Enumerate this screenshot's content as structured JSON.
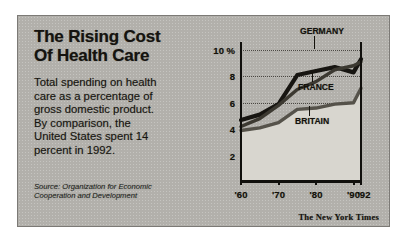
{
  "figure": {
    "headline_lines": [
      "The Rising Cost",
      "Of Health Care"
    ],
    "deck_lines": [
      "Total spending on health",
      "care as a percentage of",
      "gross domestic product.",
      "By comparison, the",
      "United States spent 14",
      "percent in 1992."
    ],
    "source_lines": [
      "Source: Organization for Economic",
      "Cooperation and Development"
    ],
    "credit": "The New York Times",
    "colors": {
      "panel_background": "#b2b0ab",
      "plot_fill": "#d8d6cf",
      "germany_line": "#171511",
      "france_line": "#3c3931",
      "britain_line": "#55524a",
      "ink": "#131109"
    }
  },
  "chart_data": {
    "type": "line",
    "title": "The Rising Cost Of Health Care",
    "subtitle": "Total spending on health care as a percentage of gross domestic product.",
    "xlabel": "",
    "ylabel": "Percent of gross domestic product",
    "xlim": [
      1960,
      1992
    ],
    "ylim": [
      0,
      10.6
    ],
    "yticks": [
      2,
      4,
      6,
      8,
      10
    ],
    "ytick_labels": [
      "2",
      "4",
      "6",
      "8",
      "10 %"
    ],
    "xticks": [
      1960,
      1970,
      1980,
      1990,
      1992
    ],
    "xtick_labels": [
      "'60",
      "'70",
      "'80",
      "'90",
      "'92"
    ],
    "grid": "horizontal-dotted",
    "legend": "inline-labels",
    "x": [
      1960,
      1965,
      1970,
      1975,
      1980,
      1985,
      1990,
      1992
    ],
    "series": [
      {
        "name": "GERMANY",
        "label": "GERMANY",
        "color": "#171511",
        "values": [
          4.7,
          5.1,
          5.9,
          8.1,
          8.4,
          8.7,
          8.3,
          9.3
        ]
      },
      {
        "name": "FRANCE",
        "label": "FRANCE",
        "color": "#3c3931",
        "values": [
          4.2,
          4.8,
          5.8,
          7.0,
          7.6,
          8.5,
          8.8,
          9.1
        ]
      },
      {
        "name": "BRITAIN",
        "label": "BRITAIN",
        "color": "#55524a",
        "values": [
          3.9,
          4.1,
          4.5,
          5.5,
          5.6,
          5.9,
          6.0,
          7.1
        ]
      }
    ],
    "annotations": [
      {
        "text": "GERMANY",
        "series": "GERMANY"
      },
      {
        "text": "FRANCE",
        "series": "FRANCE"
      },
      {
        "text": "BRITAIN",
        "series": "BRITAIN"
      }
    ],
    "source": "Source: Organization for Economic Cooperation and Development"
  }
}
